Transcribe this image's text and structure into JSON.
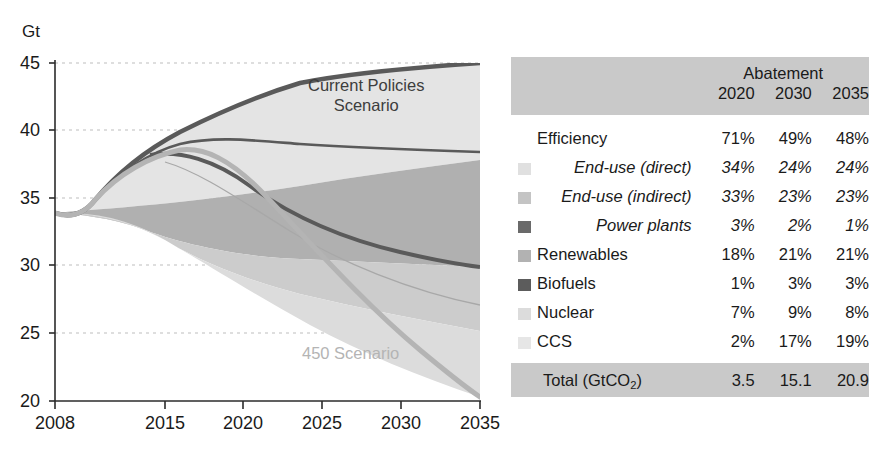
{
  "chart_data": {
    "type": "area",
    "title": "",
    "ylabel": "Gt",
    "xlabel": "",
    "xlim": [
      2008,
      2035
    ],
    "ylim": [
      20,
      45
    ],
    "grid": "horizontal-dotted",
    "x_ticks": [
      "2008",
      "2015",
      "2020",
      "2025",
      "2030",
      "2035"
    ],
    "y_ticks": [
      "20",
      "25",
      "30",
      "35",
      "40",
      "45"
    ],
    "annotations": [
      {
        "id": "current-policies",
        "text": "Current Policies\nScenario",
        "color": "#3d3d3d"
      },
      {
        "id": "450",
        "text": "450 Scenario",
        "color": "#b4b4b4"
      }
    ],
    "x": [
      2008,
      2009,
      2010,
      2011,
      2012,
      2013,
      2015,
      2017,
      2018,
      2020,
      2022,
      2025,
      2027,
      2030,
      2032,
      2035
    ],
    "series": [
      {
        "name": "Current Policies Scenario",
        "style": "dark-line",
        "values": [
          29.3,
          28.9,
          29.1,
          30.0,
          30.6,
          31.2,
          32.4,
          33.9,
          34.4,
          35.5,
          36.6,
          38.2,
          39.4,
          40.8,
          41.9,
          43.0
        ]
      },
      {
        "name": "New Policies Scenario",
        "style": "dark-line",
        "values": [
          29.3,
          28.9,
          29.1,
          30.0,
          30.6,
          31.1,
          32.0,
          32.9,
          33.1,
          33.1,
          33.1,
          33.0,
          33.0,
          32.9,
          32.8,
          32.7
        ]
      },
      {
        "name": "450 Scenario",
        "style": "light-line",
        "values": [
          29.3,
          28.9,
          29.1,
          30.0,
          30.5,
          31.0,
          31.8,
          32.5,
          32.5,
          31.6,
          30.5,
          28.6,
          27.2,
          25.3,
          23.6,
          22.0
        ]
      },
      {
        "name": "Efficiency upper boundary",
        "style": "dark-line",
        "values": [
          29.3,
          28.9,
          29.1,
          30.0,
          30.6,
          31.1,
          32.0,
          32.8,
          32.9,
          32.4,
          31.9,
          31.0,
          30.3,
          29.5,
          28.8,
          28.1
        ]
      },
      {
        "name": "Renewables boundary",
        "style": "thin-line",
        "values": [
          29.3,
          28.9,
          29.1,
          30.0,
          30.5,
          31.0,
          31.9,
          32.6,
          32.6,
          31.9,
          31.2,
          30.1,
          29.2,
          28.1,
          27.1,
          26.0
        ]
      }
    ],
    "bands": [
      {
        "name": "CCS / upper abatement wedge",
        "color": "#e4e4e4"
      },
      {
        "name": "Efficiency wedge",
        "color": "#b0b0b0"
      },
      {
        "name": "Lower abatement wedge",
        "color": "#cccccc"
      },
      {
        "name": "450 wedge",
        "color": "#dcdcdc"
      }
    ]
  },
  "table": {
    "header": {
      "abatement_label": "Abatement",
      "years": [
        "2020",
        "2030",
        "2035"
      ]
    },
    "rows": [
      {
        "label": "Efficiency",
        "swatch": null,
        "swatch_name": "none",
        "italic": false,
        "values": [
          "71%",
          "49%",
          "48%"
        ]
      },
      {
        "label": "End-use (direct)",
        "swatch": "#e0e0e0",
        "swatch_name": "swatch-end-use-direct",
        "italic": true,
        "values": [
          "34%",
          "24%",
          "24%"
        ]
      },
      {
        "label": "End-use (indirect)",
        "swatch": "#c4c4c4",
        "swatch_name": "swatch-end-use-indirect",
        "italic": true,
        "values": [
          "33%",
          "23%",
          "23%"
        ]
      },
      {
        "label": "Power plants",
        "swatch": "#6a6a6a",
        "swatch_name": "swatch-power-plants",
        "italic": true,
        "values": [
          "3%",
          "2%",
          "1%"
        ]
      },
      {
        "label": "Renewables",
        "swatch": "#b2b2b2",
        "swatch_name": "swatch-renewables",
        "italic": false,
        "values": [
          "18%",
          "21%",
          "21%"
        ]
      },
      {
        "label": "Biofuels",
        "swatch": "#5c5c5c",
        "swatch_name": "swatch-biofuels",
        "italic": false,
        "values": [
          "1%",
          "3%",
          "3%"
        ]
      },
      {
        "label": "Nuclear",
        "swatch": "#dcdcdc",
        "swatch_name": "swatch-nuclear",
        "italic": false,
        "values": [
          "7%",
          "9%",
          "8%"
        ]
      },
      {
        "label": "CCS",
        "swatch": "#e6e6e6",
        "swatch_name": "swatch-ccs",
        "italic": false,
        "values": [
          "2%",
          "17%",
          "19%"
        ]
      }
    ],
    "total": {
      "label_prefix": "Total (GtCO",
      "label_sub": "2",
      "label_suffix": ")",
      "values": [
        "3.5",
        "15.1",
        "20.9"
      ]
    }
  },
  "colors": {
    "header_band": "#c9c9c9",
    "total_band": "#c9c9c9",
    "text": "#1a1a1a",
    "dark_line": "#5a5a5a",
    "light_line": "#b4b4b4",
    "band_light": "#e4e4e4",
    "band_mid": "#b0b0b0",
    "band_lower": "#cccccc",
    "band_450": "#dcdcdc"
  }
}
